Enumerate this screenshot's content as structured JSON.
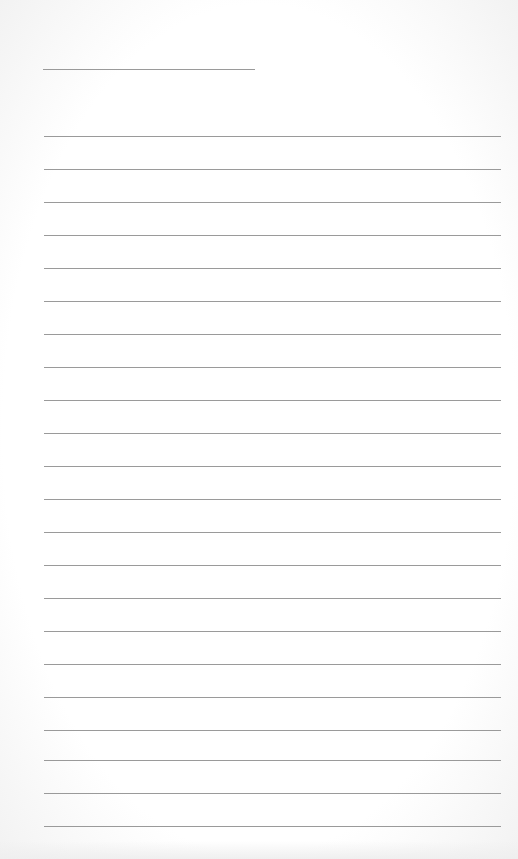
{
  "page": {
    "type": "lined-notepad",
    "title_line": {
      "text": ""
    },
    "rules": [
      {
        "y": 136,
        "text": ""
      },
      {
        "y": 169,
        "text": ""
      },
      {
        "y": 202,
        "text": ""
      },
      {
        "y": 235,
        "text": ""
      },
      {
        "y": 268,
        "text": ""
      },
      {
        "y": 301,
        "text": ""
      },
      {
        "y": 334,
        "text": ""
      },
      {
        "y": 367,
        "text": ""
      },
      {
        "y": 400,
        "text": ""
      },
      {
        "y": 433,
        "text": ""
      },
      {
        "y": 466,
        "text": ""
      },
      {
        "y": 499,
        "text": ""
      },
      {
        "y": 532,
        "text": ""
      },
      {
        "y": 565,
        "text": ""
      },
      {
        "y": 598,
        "text": ""
      },
      {
        "y": 631,
        "text": ""
      },
      {
        "y": 664,
        "text": ""
      },
      {
        "y": 697,
        "text": ""
      },
      {
        "y": 730,
        "text": ""
      },
      {
        "y": 760,
        "text": ""
      },
      {
        "y": 793,
        "text": ""
      },
      {
        "y": 826,
        "text": ""
      }
    ],
    "colors": {
      "rule": "#9a9a9a",
      "paper": "#ffffff"
    }
  }
}
